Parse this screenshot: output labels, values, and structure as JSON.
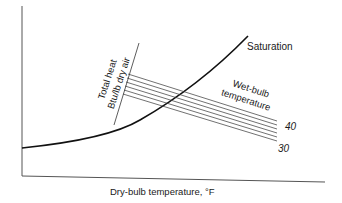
{
  "diagram": {
    "saturation_label": "Saturation",
    "total_heat_label_line1": "Total heat",
    "total_heat_label_line2": "Btu/lb dry air",
    "wet_bulb_label_line1": "Wet-bulb",
    "wet_bulb_label_line2": "temperature",
    "wet_bulb_tick_high": "40",
    "wet_bulb_tick_low": "30",
    "x_axis_label": "Dry-bulb temperature, °F"
  },
  "colors": {
    "ink": "#1a1a1a",
    "axis": "#555555",
    "background": "#ffffff"
  }
}
